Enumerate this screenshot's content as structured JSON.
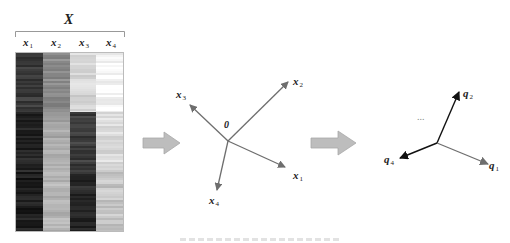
{
  "matrix": {
    "title": "X",
    "columns": [
      {
        "var": "x",
        "sub": "1"
      },
      {
        "var": "x",
        "sub": "2"
      },
      {
        "var": "x",
        "sub": "3"
      },
      {
        "var": "x",
        "sub": "4"
      }
    ],
    "blocks": [
      {
        "rows": [
          0,
          0.33
        ],
        "shades": [
          "#3a3a3a",
          "#8a8a8a",
          "#d6d6d6",
          "#f8f8f8"
        ]
      },
      {
        "rows": [
          0.33,
          0.67
        ],
        "shades": [
          "#262626",
          "#a8a8a8",
          "#3c3c3c",
          "#dcdcdc"
        ]
      },
      {
        "rows": [
          0.67,
          1.0
        ],
        "shades": [
          "#1e1e1e",
          "#b4b4b4",
          "#2a2a2a",
          "#c6c6c6"
        ]
      }
    ]
  },
  "step_arrows": [
    {
      "id": "arrow-1",
      "color": "#b5b5b5"
    },
    {
      "id": "arrow-2",
      "color": "#b5b5b5"
    }
  ],
  "original_space": {
    "origin_label": "0",
    "vectors": [
      {
        "var": "x",
        "sub": "1"
      },
      {
        "var": "x",
        "sub": "2"
      },
      {
        "var": "x",
        "sub": "3"
      },
      {
        "var": "x",
        "sub": "4"
      }
    ],
    "color": "#6e6e6e"
  },
  "transformed_space": {
    "ellipsis": "...",
    "vectors": [
      {
        "var": "q",
        "sub": "1",
        "color": "#6e6e6e"
      },
      {
        "var": "q",
        "sub": "2",
        "color": "#111111"
      },
      {
        "var": "q",
        "sub": "4",
        "color": "#111111"
      }
    ]
  }
}
